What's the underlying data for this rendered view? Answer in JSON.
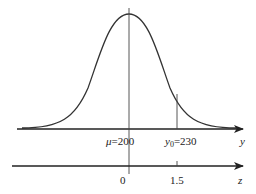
{
  "diagram": {
    "type": "normal-distribution-with-z-scale",
    "curve": {
      "description": "bell curve of normal distribution",
      "mean": 200,
      "color": "#333333"
    },
    "y_axis": {
      "label": "y",
      "ticks": [
        {
          "symbol": "μ",
          "text": "=200",
          "value": 200
        },
        {
          "symbol": "y",
          "subscript": "0",
          "text": "=230",
          "value": 230
        }
      ]
    },
    "z_axis": {
      "label": "z",
      "ticks": [
        {
          "text": "0",
          "value": 0
        },
        {
          "text": "1.5",
          "value": 1.5
        }
      ]
    },
    "colors": {
      "stroke": "#222222",
      "background": "#ffffff"
    }
  }
}
